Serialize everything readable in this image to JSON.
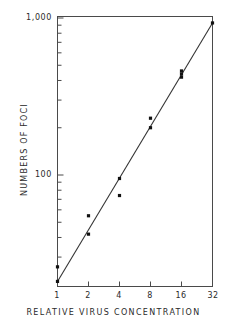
{
  "chart_data": {
    "type": "scatter",
    "title": "",
    "subtitle": "",
    "xlabel": "RELATIVE VIRUS CONCENTRATION",
    "ylabel": "NUMBERS OF FOCI",
    "xscale": "log2",
    "yscale": "log10",
    "xlim": [
      1,
      32
    ],
    "ylim": [
      20,
      1000
    ],
    "grid": false,
    "legend": null,
    "x_tick_labels": [
      "1",
      "2",
      "4",
      "8",
      "16",
      "32"
    ],
    "x_tick_values": [
      1,
      2,
      4,
      8,
      16,
      32
    ],
    "y_tick_labels": [
      "100",
      "1,000"
    ],
    "y_tick_values": [
      100,
      1000
    ],
    "y_minor_ticks": [
      30,
      40,
      50,
      60,
      70,
      80,
      90,
      200,
      300,
      400,
      500,
      600,
      700,
      800,
      900
    ],
    "marker": "filled-square",
    "marker_color": "#111111",
    "line_color": "#333333",
    "points": [
      {
        "x": 1,
        "y": 26
      },
      {
        "x": 1,
        "y": 21
      },
      {
        "x": 2,
        "y": 55
      },
      {
        "x": 2,
        "y": 42
      },
      {
        "x": 4,
        "y": 95
      },
      {
        "x": 4,
        "y": 74
      },
      {
        "x": 8,
        "y": 230
      },
      {
        "x": 8,
        "y": 200
      },
      {
        "x": 16,
        "y": 460
      },
      {
        "x": 16,
        "y": 440
      },
      {
        "x": 16,
        "y": 420
      },
      {
        "x": 32,
        "y": 930
      }
    ],
    "fit_line": {
      "description": "regression line through data",
      "x_start": 1,
      "y_start": 21,
      "x_end": 32,
      "y_end": 930
    }
  },
  "axis": {
    "y_top_label": "1,000",
    "y_mid_label": "100",
    "x_labels": [
      "1",
      "2",
      "4",
      "8",
      "16",
      "32"
    ],
    "x_title": "RELATIVE VIRUS CONCENTRATION",
    "y_title": "NUMBERS OF FOCI"
  },
  "colors": {
    "frame": "#4a4a4a",
    "marker": "#111111",
    "line": "#333333",
    "text": "#2b2b2b",
    "background": "#ffffff"
  }
}
